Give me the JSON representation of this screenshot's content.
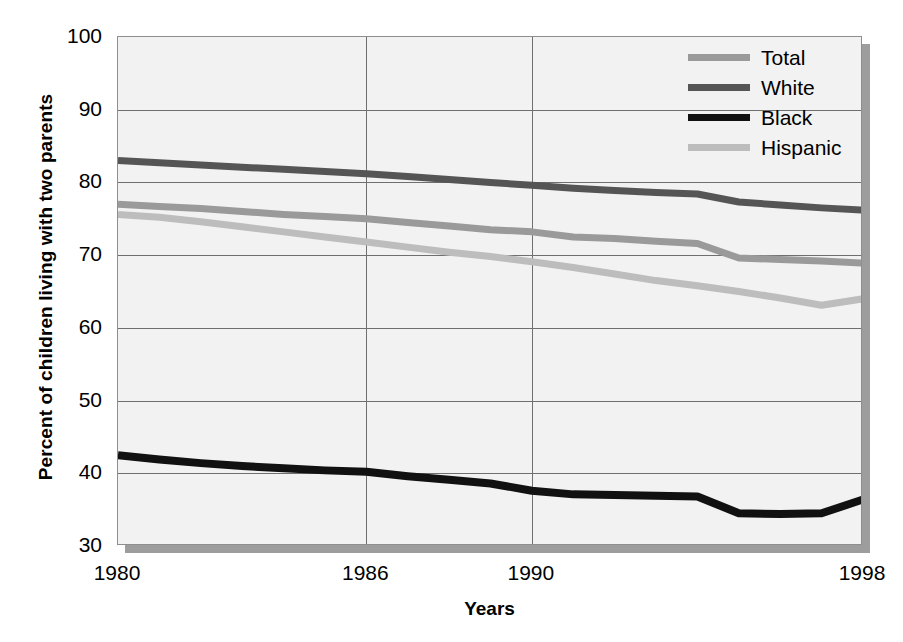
{
  "chart_data": {
    "type": "line",
    "title": "",
    "xlabel": "Years",
    "ylabel": "Percent of children living with two parents",
    "xlim": [
      1980,
      1998
    ],
    "ylim": [
      30,
      100
    ],
    "ytick_labels": [
      "100",
      "90",
      "80",
      "70",
      "60",
      "50",
      "40",
      "30"
    ],
    "yticks": [
      100,
      90,
      80,
      70,
      60,
      50,
      40,
      30
    ],
    "xtick_labels": [
      "1980",
      "1986",
      "1990",
      "1998"
    ],
    "xticks": [
      1980,
      1986,
      1990,
      1998
    ],
    "grid": "horizontal-and-vertical",
    "legend_position": "top-right",
    "x": [
      1980,
      1981,
      1982,
      1983,
      1984,
      1985,
      1986,
      1987,
      1988,
      1989,
      1990,
      1991,
      1992,
      1993,
      1994,
      1995,
      1996,
      1997,
      1998
    ],
    "series": [
      {
        "name": "Total",
        "color": "#9a9a9a",
        "values": [
          77.0,
          76.7,
          76.4,
          76.0,
          75.6,
          75.3,
          75.0,
          74.5,
          74.0,
          73.5,
          73.2,
          72.5,
          72.3,
          71.9,
          71.6,
          69.6,
          69.4,
          69.2,
          68.9
        ]
      },
      {
        "name": "White",
        "color": "#555555",
        "values": [
          83.0,
          82.7,
          82.4,
          82.1,
          81.8,
          81.5,
          81.2,
          80.8,
          80.4,
          80.0,
          79.6,
          79.2,
          78.9,
          78.6,
          78.4,
          77.3,
          76.9,
          76.5,
          76.2
        ]
      },
      {
        "name": "Black",
        "color": "#111111",
        "values": [
          42.5,
          41.9,
          41.4,
          41.0,
          40.7,
          40.4,
          40.2,
          39.6,
          39.1,
          38.6,
          37.6,
          37.1,
          37.0,
          36.9,
          36.8,
          34.5,
          34.4,
          34.5,
          36.4
        ]
      },
      {
        "name": "Hispanic",
        "color": "#bdbdbd",
        "values": [
          75.6,
          75.2,
          74.6,
          73.9,
          73.2,
          72.5,
          71.8,
          71.1,
          70.4,
          69.8,
          69.1,
          68.3,
          67.4,
          66.5,
          65.8,
          65.0,
          64.1,
          63.1,
          64.0
        ]
      }
    ]
  },
  "legend": {
    "items": [
      {
        "label": "Total",
        "color": "#9a9a9a"
      },
      {
        "label": "White",
        "color": "#555555"
      },
      {
        "label": "Black",
        "color": "#111111"
      },
      {
        "label": "Hispanic",
        "color": "#bdbdbd"
      }
    ]
  },
  "axes": {
    "y_title": "Percent of children living with two parents",
    "x_title": "Years"
  }
}
